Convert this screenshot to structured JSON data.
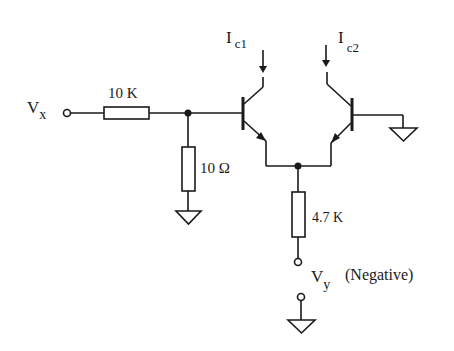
{
  "diagram": {
    "type": "differential transistor pair circuit schematic",
    "labels": {
      "input_voltage": {
        "main": "V",
        "sub": "x"
      },
      "output_voltage": {
        "main": "V",
        "sub": "y"
      },
      "output_note": "(Negative)",
      "collector_current_1": {
        "main": "I",
        "sub": "c1"
      },
      "collector_current_2": {
        "main": "I",
        "sub": "c2"
      }
    },
    "components": {
      "input_resistor": {
        "value": "10 K"
      },
      "shunt_resistor": {
        "value": "10 Ω"
      },
      "emitter_resistor": {
        "value": "4.7 K"
      },
      "transistor_1": {
        "type": "NPN"
      },
      "transistor_2": {
        "type": "NPN"
      }
    },
    "colors": {
      "line": "#1a1a1a",
      "background": "#ffffff"
    }
  }
}
